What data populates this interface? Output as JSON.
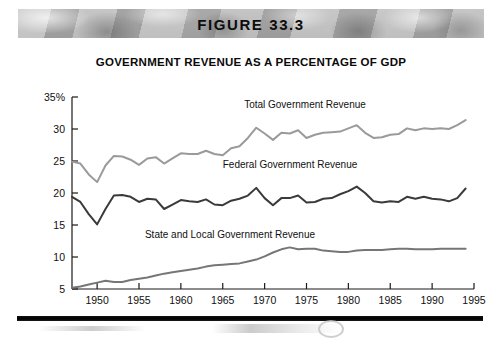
{
  "banner": {
    "figure_label": "FIGURE 33.3"
  },
  "chart_title": "GOVERNMENT REVENUE AS A PERCENTAGE OF GDP",
  "colors": {
    "total": "#9a9a9a",
    "federal": "#3a3a3a",
    "state_local": "#767676",
    "axis": "#1a1a1a",
    "banner_background": "#b0b0b0",
    "rule": "#000000"
  },
  "chart_data": {
    "type": "line",
    "title": "GOVERNMENT REVENUE AS A PERCENTAGE OF GDP",
    "xlabel": "",
    "ylabel": "",
    "xlim": [
      1947,
      1995
    ],
    "ylim": [
      5,
      35
    ],
    "grid": false,
    "legend": "inline-labels",
    "ytick_labels": [
      "35%",
      "30",
      "25",
      "20",
      "15",
      "10",
      "5"
    ],
    "ytick_values": [
      35,
      30,
      25,
      20,
      15,
      10,
      5
    ],
    "xtick_labels": [
      "1950",
      "1955",
      "1960",
      "1965",
      "1970",
      "1975",
      "1980",
      "1985",
      "1990",
      "1995"
    ],
    "xtick_values": [
      1950,
      1955,
      1960,
      1965,
      1970,
      1975,
      1980,
      1985,
      1990,
      1995
    ],
    "x": [
      1947,
      1948,
      1949,
      1950,
      1951,
      1952,
      1953,
      1954,
      1955,
      1956,
      1957,
      1958,
      1959,
      1960,
      1961,
      1962,
      1963,
      1964,
      1965,
      1966,
      1967,
      1968,
      1969,
      1970,
      1971,
      1972,
      1973,
      1974,
      1975,
      1976,
      1977,
      1978,
      1979,
      1980,
      1981,
      1982,
      1983,
      1984,
      1985,
      1986,
      1987,
      1988,
      1989,
      1990,
      1991,
      1992,
      1993,
      1994
    ],
    "series": [
      {
        "name": "Total Government Revenue",
        "color": "#9a9a9a",
        "label_text": "Total Government Revenue",
        "values": [
          24.9,
          24.6,
          22.9,
          21.7,
          24.3,
          25.8,
          25.7,
          25.2,
          24.4,
          25.4,
          25.6,
          24.6,
          25.4,
          26.2,
          26.1,
          26.1,
          26.6,
          26.1,
          25.9,
          27.0,
          27.3,
          28.6,
          30.2,
          29.3,
          28.3,
          29.4,
          29.3,
          29.8,
          28.6,
          29.1,
          29.4,
          29.5,
          29.6,
          30.1,
          30.6,
          29.4,
          28.6,
          28.7,
          29.1,
          29.2,
          30.1,
          29.8,
          30.1,
          30.0,
          30.1,
          30.0,
          30.6,
          31.4
        ]
      },
      {
        "name": "Federal Government Revenue",
        "color": "#3a3a3a",
        "label_text": "Federal Government Revenue",
        "values": [
          19.4,
          18.6,
          16.7,
          15.1,
          17.5,
          19.6,
          19.7,
          19.4,
          18.6,
          19.1,
          19.0,
          17.5,
          18.2,
          18.9,
          18.7,
          18.6,
          19.0,
          18.2,
          18.1,
          18.8,
          19.1,
          19.6,
          20.8,
          19.2,
          18.1,
          19.2,
          19.2,
          19.6,
          18.5,
          18.6,
          19.1,
          19.2,
          19.8,
          20.3,
          21.0,
          20.0,
          18.7,
          18.5,
          18.7,
          18.6,
          19.4,
          19.1,
          19.4,
          19.1,
          19.0,
          18.7,
          19.2,
          20.7
        ]
      },
      {
        "name": "State and Local Government Revenue",
        "color": "#767676",
        "label_text": "State and Local Government Revenue",
        "values": [
          5.2,
          5.4,
          5.7,
          6.0,
          6.3,
          6.1,
          6.1,
          6.4,
          6.6,
          6.8,
          7.1,
          7.4,
          7.6,
          7.8,
          8.0,
          8.2,
          8.5,
          8.7,
          8.8,
          8.9,
          9.0,
          9.3,
          9.6,
          10.1,
          10.7,
          11.2,
          11.5,
          11.2,
          11.3,
          11.3,
          11.0,
          10.9,
          10.8,
          10.8,
          11.0,
          11.1,
          11.1,
          11.1,
          11.2,
          11.3,
          11.3,
          11.2,
          11.2,
          11.2,
          11.3,
          11.3,
          11.3,
          11.3
        ]
      }
    ],
    "series_label_positions": [
      {
        "series": "Total Government Revenue",
        "x_px": 305,
        "y_px": 108
      },
      {
        "series": "Federal Government Revenue",
        "x_px": 290,
        "y_px": 168
      },
      {
        "series": "State and Local Government Revenue",
        "x_px": 230,
        "y_px": 238
      }
    ]
  }
}
